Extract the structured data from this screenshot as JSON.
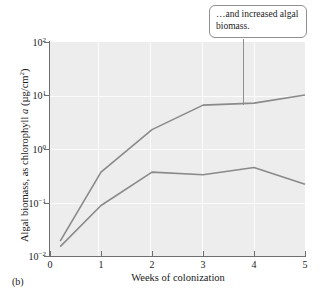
{
  "figure": {
    "panel_label": "(b)",
    "line_color": "#8a8a8a",
    "plot_background": "#ededed"
  },
  "callout": {
    "text": "…and increased algal biomass.",
    "anchor_week": 3.8
  },
  "chart_data": {
    "type": "line",
    "title": "",
    "xlabel": "Weeks of colonization",
    "ylabel": "Algal biomass, as chlorophyll a (µg/cm²)",
    "ylabel_parts": {
      "prefix": "Algal biomass, as chlorophyll ",
      "italic": "a",
      "suffix": " (µg/cm",
      "sup": "2",
      "tail": ")"
    },
    "yscale": "log",
    "xlim": [
      0,
      5
    ],
    "ylim": [
      0.01,
      100
    ],
    "grid": true,
    "legend": "none",
    "xticks": [
      "0",
      "1",
      "2",
      "3",
      "4",
      "5"
    ],
    "yticks": [
      {
        "base": "10",
        "exp": "2",
        "value": 100
      },
      {
        "base": "10",
        "exp": "1",
        "value": 10
      },
      {
        "base": "10",
        "exp": "0",
        "value": 1
      },
      {
        "base": "10",
        "exp": "−1",
        "value": 0.1
      },
      {
        "base": "10",
        "exp": "−2",
        "value": 0.01
      }
    ],
    "series": [
      {
        "name": "upper-curve",
        "x": [
          0.2,
          1,
          2,
          3,
          4,
          5
        ],
        "values": [
          0.019,
          0.37,
          2.3,
          6.6,
          7.2,
          10.2
        ]
      },
      {
        "name": "lower-curve",
        "x": [
          0.2,
          1,
          2,
          3,
          4,
          5
        ],
        "values": [
          0.015,
          0.088,
          0.37,
          0.33,
          0.45,
          0.22
        ]
      }
    ]
  }
}
